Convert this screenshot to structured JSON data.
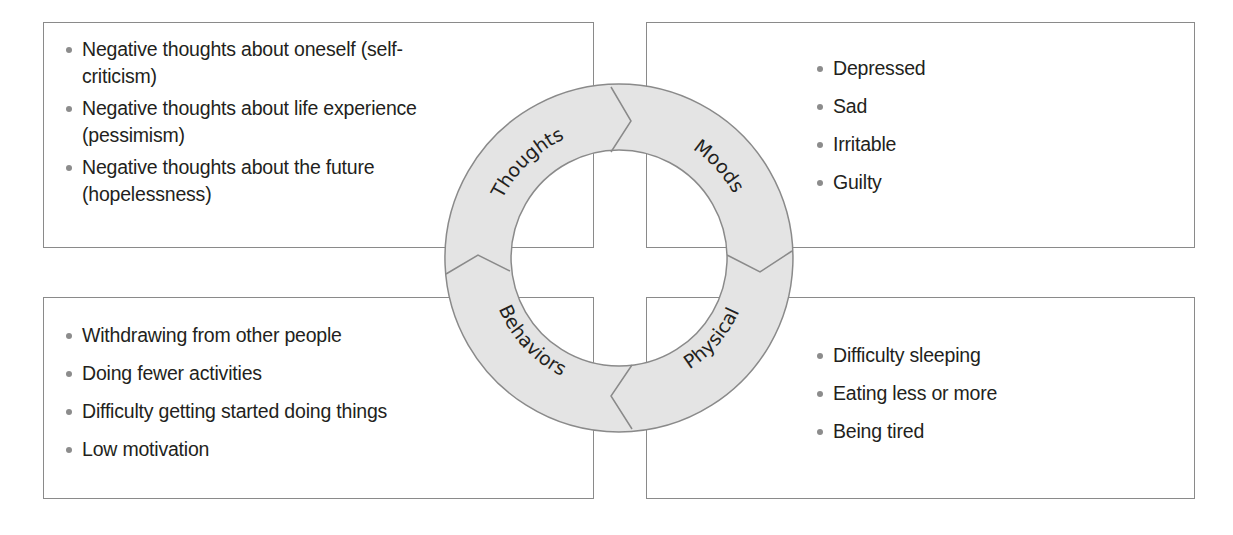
{
  "diagram": {
    "type": "cycle-with-quadrants",
    "colors": {
      "ring_fill": "#e4e4e4",
      "ring_stroke": "#8a8a8a",
      "box_border": "#8a8a8a",
      "bullet": "#8c8c8c",
      "text": "#231f20"
    },
    "cycle": {
      "segments": [
        {
          "id": "thoughts",
          "label": "Thoughts"
        },
        {
          "id": "moods",
          "label": "Moods"
        },
        {
          "id": "physical",
          "label": "Physical"
        },
        {
          "id": "behaviors",
          "label": "Behaviors"
        }
      ]
    },
    "quadrants": {
      "thoughts": {
        "items": [
          "Negative thoughts about oneself (self-criticism)",
          "Negative thoughts about life experience (pessimism)",
          "Negative thoughts about the future (hopelessness)"
        ]
      },
      "moods": {
        "items": [
          "Depressed",
          "Sad",
          "Irritable",
          "Guilty"
        ]
      },
      "behaviors": {
        "items": [
          "Withdrawing from other people",
          "Doing fewer activities",
          "Difficulty getting started doing things",
          "Low motivation"
        ]
      },
      "physical": {
        "items": [
          "Difficulty sleeping",
          "Eating less or more",
          "Being tired"
        ]
      }
    }
  }
}
